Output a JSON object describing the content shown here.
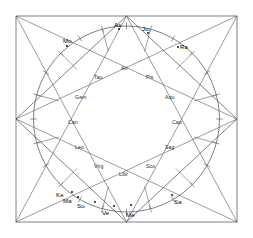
{
  "chart_data": {
    "type": "scatter",
    "title": "",
    "xlabel": "",
    "ylabel": "",
    "geometry": {
      "square": {
        "x": 16,
        "y": 16,
        "width": 221,
        "height": 206
      },
      "circle": {
        "cx": 126.5,
        "cy": 119,
        "r": 93
      },
      "inner_circle_r": 78,
      "diamond_vertices": [
        [
          126.5,
          16
        ],
        [
          237,
          119
        ],
        [
          126.5,
          222
        ],
        [
          16,
          119
        ]
      ]
    },
    "signs": [
      {
        "name": "Ari",
        "angle_deg": 90,
        "x": 121,
        "y": 66
      },
      {
        "name": "Tau",
        "angle_deg": 120,
        "x": 94,
        "y": 75
      },
      {
        "name": "Gem",
        "angle_deg": 150,
        "x": 75,
        "y": 95
      },
      {
        "name": "Can",
        "angle_deg": 180,
        "x": 68,
        "y": 120
      },
      {
        "name": "Leo",
        "angle_deg": 210,
        "x": 75,
        "y": 145
      },
      {
        "name": "Virg",
        "angle_deg": 240,
        "x": 94,
        "y": 164
      },
      {
        "name": "Libr",
        "angle_deg": 270,
        "x": 119,
        "y": 172
      },
      {
        "name": "Sco",
        "angle_deg": 300,
        "x": 146,
        "y": 164
      },
      {
        "name": "Sag",
        "angle_deg": 330,
        "x": 165,
        "y": 145
      },
      {
        "name": "Cap",
        "angle_deg": 0,
        "x": 172,
        "y": 120
      },
      {
        "name": "Aqu",
        "angle_deg": 30,
        "x": 165,
        "y": 95
      },
      {
        "name": "Pis",
        "angle_deg": 60,
        "x": 146,
        "y": 75
      }
    ],
    "planets": [
      {
        "name": "As",
        "label_x": 114,
        "label_y": 22,
        "dot_x": 119,
        "dot_y": 29
      },
      {
        "name": "Ju",
        "label_x": 142,
        "label_y": 26,
        "dot_x": 148,
        "dot_y": 33
      },
      {
        "name": "Ra",
        "label_x": 180,
        "label_y": 44,
        "dot_x": 178,
        "dot_y": 47
      },
      {
        "name": "Mo",
        "label_x": 63,
        "label_y": 38,
        "dot_x": 67,
        "dot_y": 46
      },
      {
        "name": "Ke",
        "label_x": 56,
        "label_y": 192,
        "dot_x": 72,
        "dot_y": 192
      },
      {
        "name": "Ma",
        "label_x": 63,
        "label_y": 198,
        "dot_x": 78,
        "dot_y": 197
      },
      {
        "name": "Su",
        "label_x": 77,
        "label_y": 203,
        "dot_x": 95,
        "dot_y": 202
      },
      {
        "name": "Ve",
        "label_x": 102,
        "label_y": 210,
        "dot_x": 114,
        "dot_y": 206
      },
      {
        "name": "Me",
        "label_x": 126,
        "label_y": 212,
        "dot_x": 131,
        "dot_y": 205
      },
      {
        "name": "Sa",
        "label_x": 174,
        "label_y": 199,
        "dot_x": 172,
        "dot_y": 195
      }
    ],
    "house_cusp_angles_deg": [
      75,
      105,
      135,
      165,
      195,
      225,
      255,
      285,
      315,
      345,
      15,
      45
    ],
    "tick_angles_deg": [
      0,
      30,
      60,
      90,
      120,
      150,
      180,
      210,
      240,
      270,
      300,
      330,
      15,
      45,
      75,
      105,
      135,
      165,
      195,
      225,
      255,
      285,
      315,
      345
    ],
    "colors": {
      "line": "#4a4a4a",
      "circle": "#555555",
      "text": "#1a1a1a",
      "background": "#ffffff",
      "dot": "#000000"
    }
  }
}
